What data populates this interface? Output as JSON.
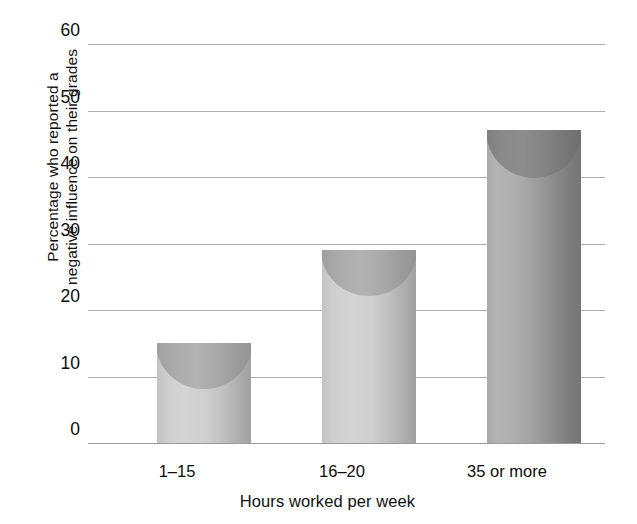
{
  "chart_data": {
    "type": "bar",
    "title": "",
    "categories": [
      "1–15",
      "16–20",
      "35 or more"
    ],
    "values": [
      15,
      29,
      47
    ],
    "series": [
      {
        "name": "Percentage who reported a negative influence on their grades",
        "values": [
          15,
          29,
          47
        ]
      }
    ],
    "xlabel": "Hours worked per week",
    "ylabel_line1": "Percentage who reported a",
    "ylabel_line2": "negative influence on their grades",
    "ylabel": "Percentage who reported a negative influence on their grades",
    "ylim": [
      0,
      60
    ],
    "yticks": [
      0,
      10,
      20,
      30,
      40,
      50,
      60
    ],
    "ytick_labels": [
      "0",
      "10",
      "20",
      "30",
      "40",
      "50",
      "60"
    ],
    "grid": true,
    "legend": "none",
    "bar_style": "3d-cylinder",
    "colors": {
      "bar_light": "#c9c9c9",
      "bar_light_cap": "#a6a6a6",
      "bar_dark": "#9b9b9b",
      "bar_dark_cap": "#808080",
      "gridline": "#aeaeae",
      "text": "#111111",
      "background": "#ffffff"
    }
  }
}
